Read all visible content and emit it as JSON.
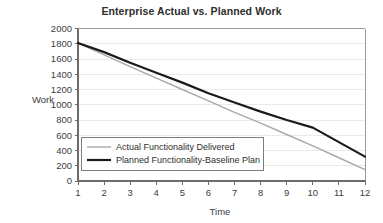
{
  "chart_data": {
    "type": "line",
    "title": "Enterprise Actual vs. Planned Work",
    "xlabel": "Time",
    "ylabel": "Work",
    "x": [
      1,
      2,
      3,
      4,
      5,
      6,
      7,
      8,
      9,
      10,
      11,
      12
    ],
    "xticklabels": [
      "1",
      "2",
      "3",
      "4",
      "5",
      "6",
      "7",
      "8",
      "9",
      "10",
      "11",
      "12"
    ],
    "yticks": [
      0,
      200,
      400,
      600,
      800,
      1000,
      1200,
      1400,
      1600,
      1800,
      2000
    ],
    "yticklabels": [
      "0",
      "200",
      "400",
      "600",
      "800",
      "1000",
      "1200",
      "1400",
      "1600",
      "1800",
      "2000"
    ],
    "xlim": [
      1,
      12
    ],
    "ylim": [
      0,
      2000
    ],
    "grid": "horizontal",
    "legend_position": "lower-left-inside",
    "series": [
      {
        "name": "Actual Functionality Delivered",
        "color": "#a8a8a8",
        "width": 1.4,
        "values": [
          1810,
          1655,
          1500,
          1350,
          1200,
          1050,
          900,
          760,
          610,
          460,
          305,
          150
        ]
      },
      {
        "name": "Planned Functionality-Baseline Plan",
        "color": "#1a1a1a",
        "width": 2.2,
        "values": [
          1810,
          1690,
          1550,
          1420,
          1290,
          1150,
          1030,
          910,
          800,
          700,
          510,
          320
        ]
      }
    ]
  },
  "legend": {
    "entries": [
      {
        "label": "Actual Functionality Delivered",
        "color": "#a8a8a8",
        "width": 1.4
      },
      {
        "label": "Planned Functionality-Baseline Plan",
        "color": "#1a1a1a",
        "width": 2.2
      }
    ]
  },
  "colors": {
    "axis": "#6b6b6b",
    "grid": "#e9e9e9",
    "text": "#3d3d3d",
    "background": "#ffffff"
  }
}
